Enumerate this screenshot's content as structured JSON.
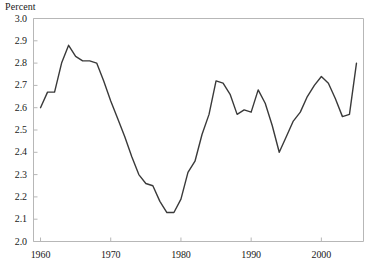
{
  "chart_data": {
    "type": "line",
    "title": "",
    "ylabel": "Percent",
    "xlabel": "",
    "ylim": [
      2.0,
      3.0
    ],
    "xlim": [
      1959,
      2006
    ],
    "grid": false,
    "legend": null,
    "line_color": "#3a3a3a",
    "frame_color": "#b7b7b7",
    "ytick_labels": [
      "3.0",
      "2.9",
      "2.8",
      "2.7",
      "2.6",
      "2.5",
      "2.4",
      "2.3",
      "2.2",
      "2.1",
      "2.0"
    ],
    "ytick_values": [
      3.0,
      2.9,
      2.8,
      2.7,
      2.6,
      2.5,
      2.4,
      2.3,
      2.2,
      2.1,
      2.0
    ],
    "xtick_labels": [
      "1960",
      "1970",
      "1980",
      "1990",
      "2000"
    ],
    "xtick_values": [
      1960,
      1970,
      1980,
      1990,
      2000
    ],
    "x": [
      1960,
      1961,
      1962,
      1963,
      1964,
      1965,
      1966,
      1967,
      1968,
      1969,
      1970,
      1971,
      1972,
      1973,
      1974,
      1975,
      1976,
      1977,
      1978,
      1979,
      1980,
      1981,
      1982,
      1983,
      1984,
      1985,
      1986,
      1987,
      1988,
      1989,
      1990,
      1991,
      1992,
      1993,
      1994,
      1995,
      1996,
      1997,
      1998,
      1999,
      2000,
      2001,
      2002,
      2003,
      2004,
      2005
    ],
    "values": [
      2.6,
      2.67,
      2.67,
      2.8,
      2.88,
      2.83,
      2.81,
      2.81,
      2.8,
      2.72,
      2.63,
      2.55,
      2.47,
      2.38,
      2.3,
      2.26,
      2.25,
      2.18,
      2.13,
      2.13,
      2.19,
      2.31,
      2.36,
      2.48,
      2.57,
      2.72,
      2.71,
      2.66,
      2.57,
      2.59,
      2.58,
      2.68,
      2.62,
      2.52,
      2.4,
      2.47,
      2.54,
      2.58,
      2.65,
      2.7,
      2.74,
      2.71,
      2.64,
      2.56,
      2.57,
      2.8
    ],
    "series": [
      {
        "name": "Percent",
        "values": [
          2.6,
          2.67,
          2.67,
          2.8,
          2.88,
          2.83,
          2.81,
          2.81,
          2.8,
          2.72,
          2.63,
          2.55,
          2.47,
          2.38,
          2.3,
          2.26,
          2.25,
          2.18,
          2.13,
          2.13,
          2.19,
          2.31,
          2.36,
          2.48,
          2.57,
          2.72,
          2.71,
          2.66,
          2.57,
          2.59,
          2.58,
          2.68,
          2.62,
          2.52,
          2.4,
          2.47,
          2.54,
          2.58,
          2.65,
          2.7,
          2.74,
          2.71,
          2.64,
          2.56,
          2.57,
          2.8
        ]
      }
    ]
  }
}
